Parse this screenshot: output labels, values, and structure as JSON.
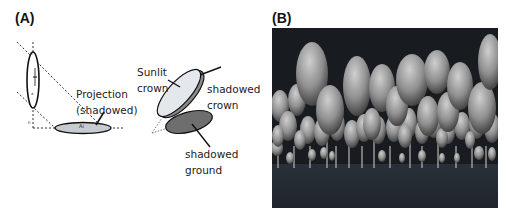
{
  "panel_a": {
    "label": "(A)",
    "projection_label_line1": "Projection",
    "projection_label_line2": "(shadowed)",
    "ellipse_label_ai": "Ai",
    "crown_labels": {
      "sunlit_line1": "Sunlit",
      "sunlit_line2": "crown",
      "shadowed_crown_line1": "shadowed",
      "shadowed_crown_line2": "crown",
      "shadowed_ground_line1": "shadowed",
      "shadowed_ground_line2": "ground"
    },
    "colors": {
      "projection_fill": "#c8ccd0",
      "sunlit_fill": "#e4e8ec",
      "shadow_fill": "#6e6e6e",
      "stroke": "#111111"
    }
  },
  "panel_b": {
    "label": "(B)",
    "description": "3D rendered forest of ellipsoid tree crowns over dark ground",
    "colors": {
      "sky": "#1a1d22",
      "ground": "#262b33",
      "crown_light": "#c8c8c8",
      "crown_dark": "#3a3a3a"
    }
  }
}
